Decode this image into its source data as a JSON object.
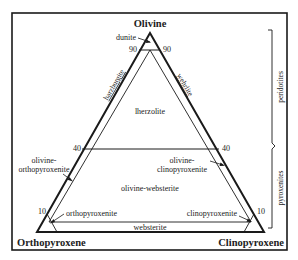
{
  "diagram": {
    "vertices": {
      "top": "Olivine",
      "bottom_left": "Orthopyroxene",
      "bottom_right": "Clinopyroxene"
    },
    "ticks": {
      "left_90": "90",
      "right_90": "90",
      "left_40": "40",
      "right_40": "40",
      "left_10": "10",
      "right_10": "10"
    },
    "fields": {
      "dunite": "dunite",
      "harzburgite": "harzburgite",
      "wehrlite": "wehrlite",
      "lherzolite": "lherzolite",
      "olivine_orthopyroxenite_1": "olivine-",
      "olivine_orthopyroxenite_2": "orthopyroxenite",
      "olivine_clinopyroxenite_1": "olivine-",
      "olivine_clinopyroxenite_2": "clinopyroxenite",
      "olivine_websterite": "olivine-websterite",
      "orthopyroxenite": "orthopyroxenite",
      "clinopyroxenite": "clinopyroxenite",
      "websterite": "websterite"
    },
    "groups": {
      "peridotites": "peridotites",
      "pyroxenites": "pyroxenites"
    },
    "boundaries_percent_olivine": [
      90,
      40,
      10
    ]
  }
}
